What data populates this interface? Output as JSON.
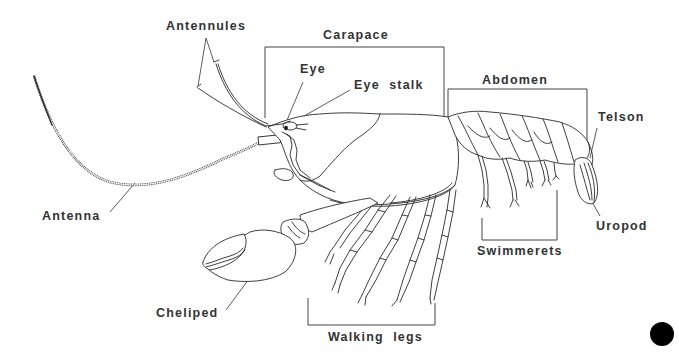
{
  "figure": {
    "background_color": "#ffffff",
    "line_color": "#2a2a2a",
    "label_color": "#333333"
  },
  "labels": {
    "antennules": "Antennules",
    "carapace": "Carapace",
    "eye": "Eye",
    "eye_stalk": "Eye  stalk",
    "abdomen": "Abdomen",
    "telson": "Telson",
    "antenna": "Antenna",
    "uropod": "Uropod",
    "swimmerets": "Swimmerets",
    "cheliped": "Cheliped",
    "walking_legs": "Walking  legs"
  },
  "marker": {
    "shape": "filled-circle",
    "color": "#000000"
  }
}
